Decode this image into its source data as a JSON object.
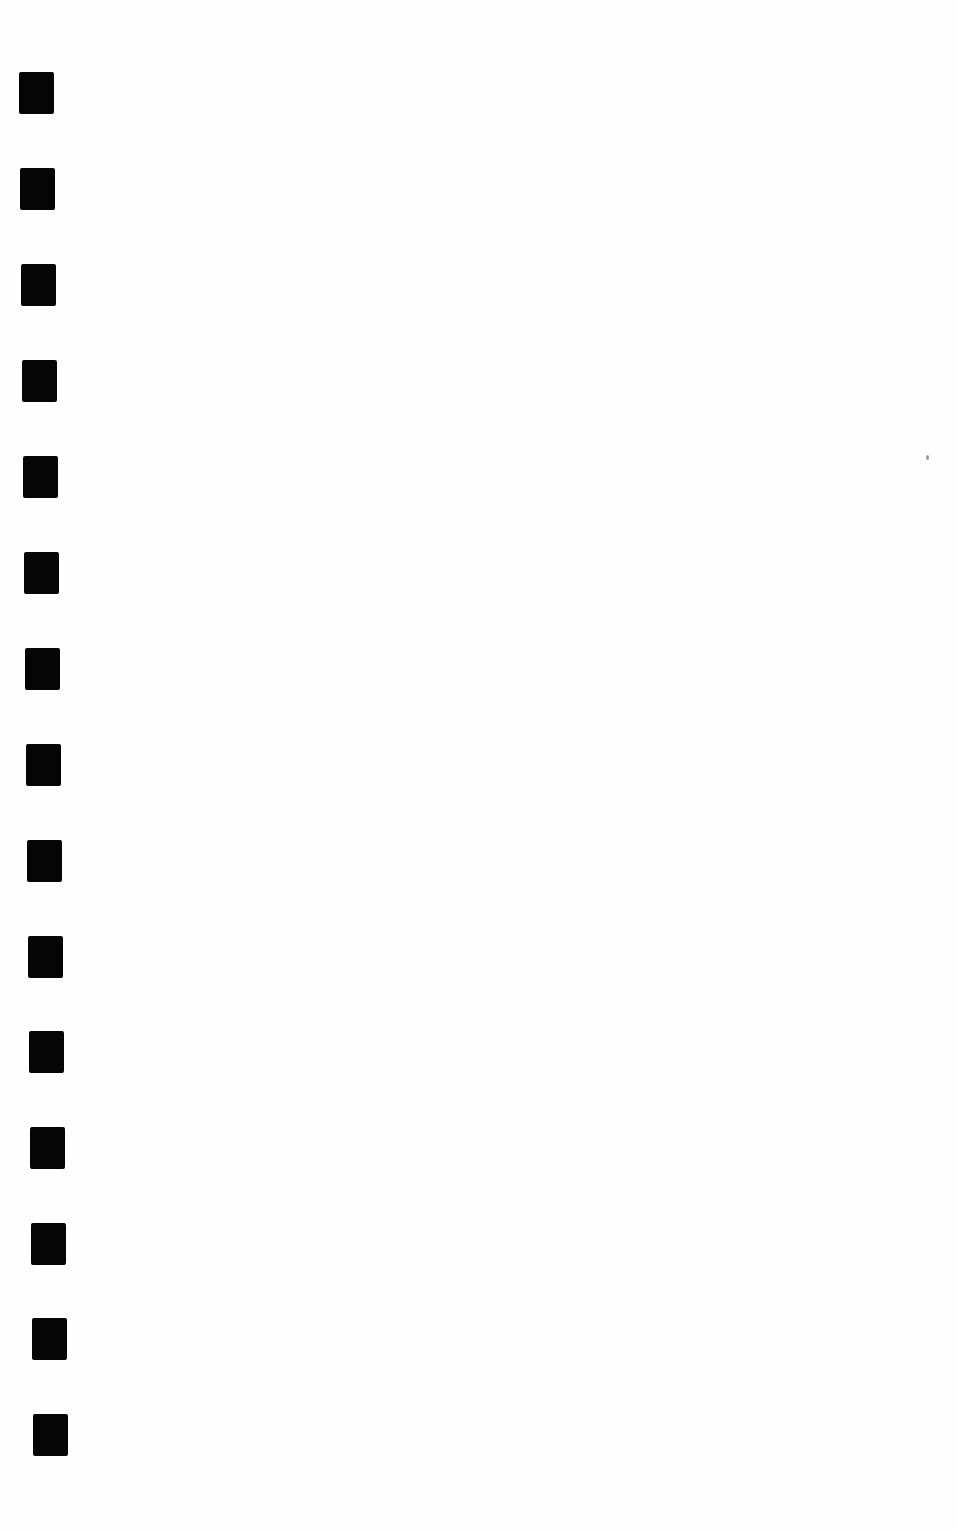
{
  "page": {
    "background": "#fefefe",
    "mark_color": "#050505"
  },
  "marks": [
    {
      "x": 19,
      "y": 72
    },
    {
      "x": 20,
      "y": 168
    },
    {
      "x": 21,
      "y": 264
    },
    {
      "x": 22,
      "y": 360
    },
    {
      "x": 23,
      "y": 456
    },
    {
      "x": 24,
      "y": 552
    },
    {
      "x": 25,
      "y": 648
    },
    {
      "x": 26,
      "y": 744
    },
    {
      "x": 27,
      "y": 840
    },
    {
      "x": 28,
      "y": 936
    },
    {
      "x": 29,
      "y": 1031
    },
    {
      "x": 30,
      "y": 1127
    },
    {
      "x": 31,
      "y": 1223
    },
    {
      "x": 32,
      "y": 1318
    },
    {
      "x": 33,
      "y": 1414
    }
  ],
  "specks": [
    {
      "x": 926,
      "y": 455
    }
  ]
}
